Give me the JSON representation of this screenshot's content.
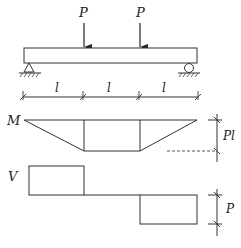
{
  "diagram": {
    "type": "beam-shear-moment",
    "loads": [
      {
        "label": "P",
        "position": "l from left"
      },
      {
        "label": "P",
        "position": "2l from left"
      }
    ],
    "supports": [
      {
        "type": "pin",
        "position": "left"
      },
      {
        "type": "roller",
        "position": "right"
      }
    ],
    "spans": [
      "l",
      "l",
      "l"
    ],
    "moment_diagram": {
      "label": "M",
      "max_label": "Pl"
    },
    "shear_diagram": {
      "label": "V",
      "magnitude_label": "P"
    }
  }
}
